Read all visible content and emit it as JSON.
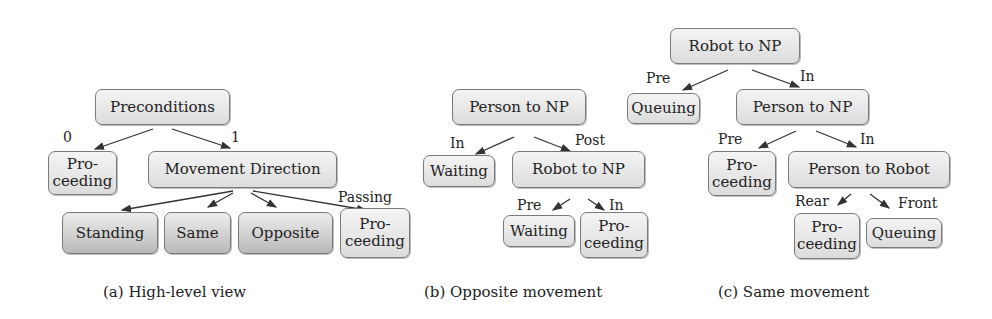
{
  "subfigures": [
    {
      "id": "a",
      "caption": "(a) High-level view",
      "nodes": {
        "preconditions": "Preconditions",
        "proceeding_0": "Pro-\nceeding",
        "movement_direction": "Movement Direction",
        "standing": "Standing",
        "same": "Same",
        "opposite": "Opposite",
        "proceeding_passing": "Pro-\nceeding"
      },
      "edge_labels": {
        "to_proceeding": "0",
        "to_movement_direction": "1",
        "to_proceeding_passing": "Passing"
      }
    },
    {
      "id": "b",
      "caption": "(b) Opposite movement",
      "nodes": {
        "person_to_np": "Person to NP",
        "waiting_1": "Waiting",
        "robot_to_np": "Robot to NP",
        "waiting_2": "Waiting",
        "proceeding": "Pro-\nceeding"
      },
      "edge_labels": {
        "to_waiting_1": "In",
        "to_robot_to_np": "Post",
        "to_waiting_2": "Pre",
        "to_proceeding": "In"
      }
    },
    {
      "id": "c",
      "caption": "(c) Same movement",
      "nodes": {
        "robot_to_np": "Robot to NP",
        "queuing_1": "Queuing",
        "person_to_np": "Person to NP",
        "proceeding_1": "Pro-\nceeding",
        "person_to_robot": "Person to Robot",
        "proceeding_2": "Pro-\nceeding",
        "queuing_2": "Queuing"
      },
      "edge_labels": {
        "to_queuing_1": "Pre",
        "to_person_to_np": "In",
        "to_proceeding_1": "Pre",
        "to_person_to_robot": "In",
        "to_proceeding_2": "Rear",
        "to_queuing_2": "Front"
      }
    }
  ],
  "colors": {
    "node_border": "#7a7a7a",
    "edge": "#333333"
  }
}
